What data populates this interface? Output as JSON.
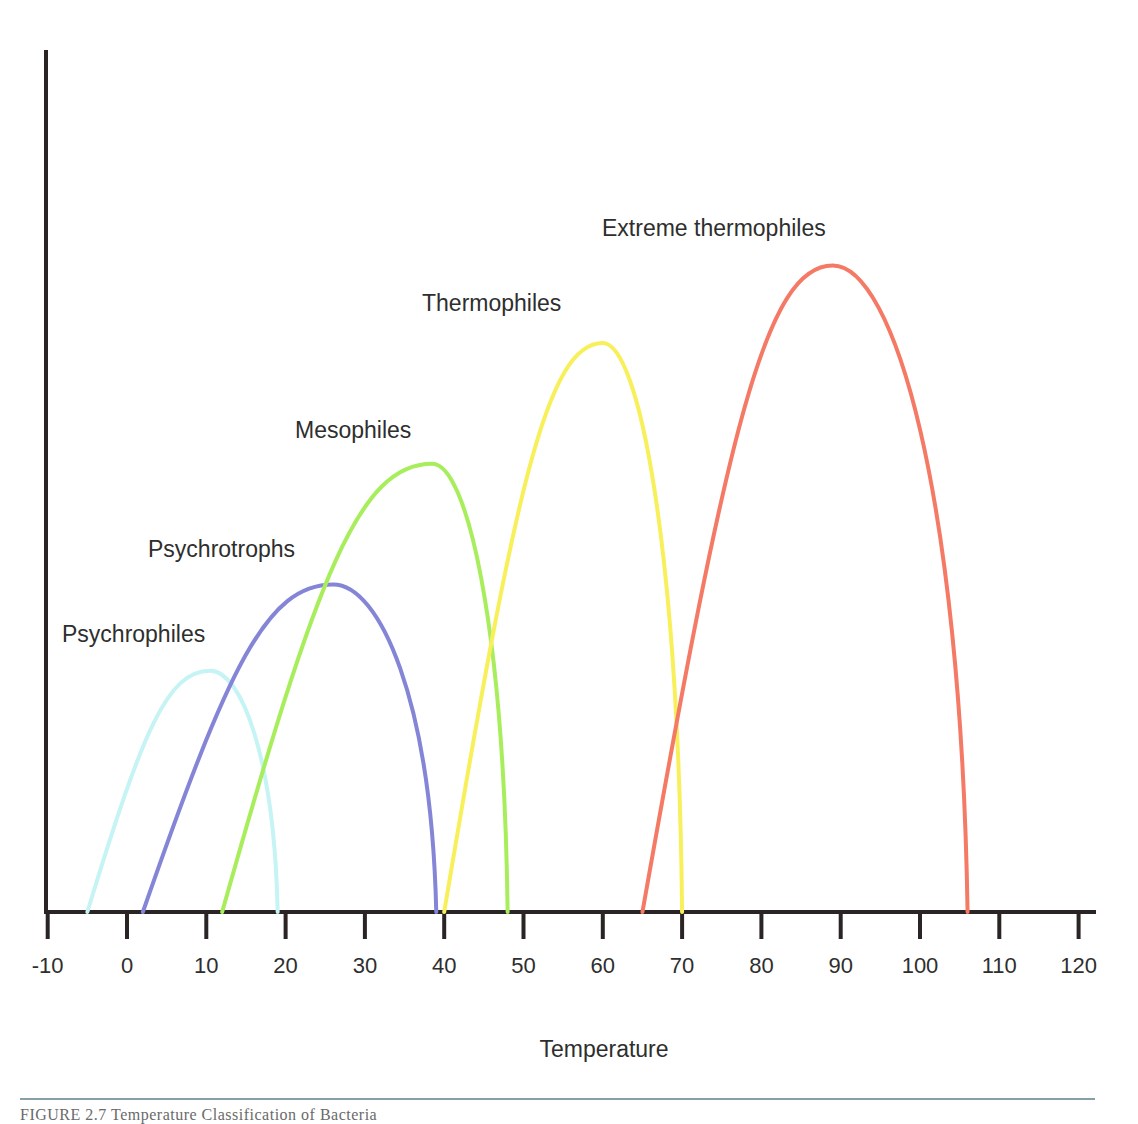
{
  "chart_data": {
    "type": "line",
    "title": "",
    "xlabel": "Temperature",
    "ylabel": "",
    "xlim": [
      -10,
      122
    ],
    "x_ticks": [
      -10,
      0,
      10,
      20,
      30,
      40,
      50,
      60,
      70,
      80,
      90,
      100,
      110,
      120
    ],
    "x_tick_labels": [
      "-10",
      "0",
      "10",
      "20",
      "30",
      "40",
      "50",
      "60",
      "70",
      "80",
      "90",
      "100",
      "110",
      "120"
    ],
    "y_ticks": [],
    "grid": false,
    "legend": "none (curves labeled inline)",
    "series": [
      {
        "name": "Psychrophiles",
        "color": "#c6f3f3",
        "min": -5,
        "optimum": 10.5,
        "max": 19,
        "relative_peak": 0.28,
        "label_pos": [
          62,
          642
        ]
      },
      {
        "name": "Psychrotrophs",
        "color": "#8585d8",
        "min": 2,
        "optimum": 26,
        "max": 39,
        "relative_peak": 0.38,
        "label_pos": [
          148,
          557
        ]
      },
      {
        "name": "Mesophiles",
        "color": "#a8ee5c",
        "min": 12,
        "optimum": 38.5,
        "max": 48,
        "relative_peak": 0.52,
        "label_pos": [
          295,
          438
        ]
      },
      {
        "name": "Thermophiles",
        "color": "#f8f05a",
        "min": 40,
        "optimum": 60,
        "max": 70,
        "relative_peak": 0.66,
        "label_pos": [
          422,
          311
        ]
      },
      {
        "name": "Extreme thermophiles",
        "color": "#f47a66",
        "min": 65,
        "optimum": 89,
        "max": 106,
        "relative_peak": 0.75,
        "label_pos": [
          602,
          236
        ]
      }
    ]
  },
  "caption": {
    "text": "FIGURE 2.7 Temperature Classification of Bacteria"
  }
}
